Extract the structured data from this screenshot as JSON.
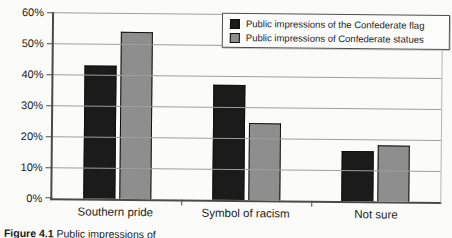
{
  "chart_data": {
    "type": "bar",
    "title": "",
    "categories": [
      "Southern pride",
      "Symbol of racism",
      "Not sure"
    ],
    "series": [
      {
        "name": "Public impressions of the Confederate flag",
        "color": "#1b1b1b",
        "values": [
          43,
          37,
          16
        ]
      },
      {
        "name": "Public impressions of Confederate statues",
        "color": "#8e8e8e",
        "values": [
          54,
          25,
          18
        ]
      }
    ],
    "ylim": [
      0,
      60
    ],
    "ytick_step": 10,
    "ytick_labels": [
      "0%",
      "10%",
      "20%",
      "30%",
      "40%",
      "50%",
      "60%"
    ],
    "ylabel": "",
    "xlabel": "",
    "grid": "horizontal",
    "legend_position": "top-right"
  },
  "caption": {
    "label": "Figure 4.1",
    "text": "Public impressions of"
  },
  "colors": {
    "background": "#fbfbf9",
    "gridline": "#9e9e9e",
    "axis": "#4a4a4a",
    "bar_border": "#101010",
    "legend_border": "#4f4f4f",
    "text": "#1c1c1c"
  }
}
